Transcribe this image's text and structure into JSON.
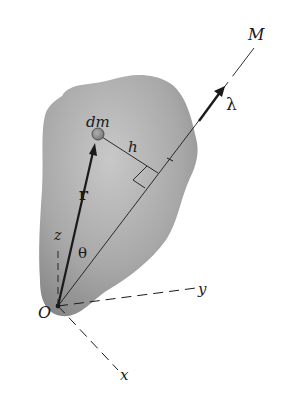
{
  "diagram": {
    "colors": {
      "body_fill_light": "#c4c4c4",
      "body_fill_dark": "#8a8a8a",
      "line": "#1a1a1a",
      "mass_element": "#9a9a9a"
    },
    "labels": {
      "axis_M": "M",
      "unit_vector": "λ",
      "mass_element": "dm",
      "distance": "h",
      "position_vector": "r",
      "angle": "θ",
      "axis_z": "z",
      "axis_y": "y",
      "axis_x": "x",
      "origin": "O"
    }
  }
}
